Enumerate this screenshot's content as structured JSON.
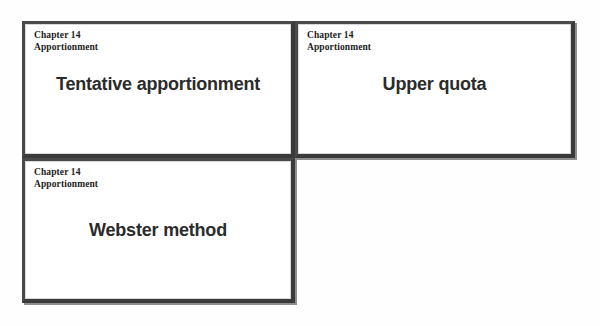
{
  "page": {
    "kind": "powerpoint-handout-scan",
    "background_color": "#fefefe",
    "slide_border_color": "#3a3a3a",
    "slide_shadow_color": "#8e8e8e",
    "slide_background": "#ffffff",
    "header_text_color": "#1c1c1c",
    "title_text_color": "#2b2b2b"
  },
  "slides": [
    {
      "position": "top-left",
      "header_line1": "Chapter 14",
      "header_line2": "Apportionment",
      "title": "Tentative apportionment"
    },
    {
      "position": "top-right",
      "header_line1": "Chapter 14",
      "header_line2": "Apportionment",
      "title": "Upper quota"
    },
    {
      "position": "bottom-left",
      "header_line1": "Chapter 14",
      "header_line2": "Apportionment",
      "title": "Webster method"
    }
  ]
}
